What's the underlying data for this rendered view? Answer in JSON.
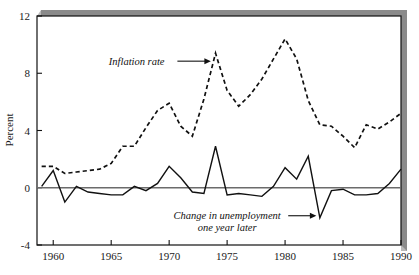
{
  "chart_data": {
    "type": "line",
    "title": "",
    "subtitle": "",
    "xlabel": "",
    "ylabel": "Percent",
    "xlim": [
      1958.6,
      1990
    ],
    "ylim": [
      -4,
      12
    ],
    "xticks": [
      1960,
      1965,
      1970,
      1975,
      1980,
      1985,
      1990
    ],
    "yticks": [
      -4,
      0,
      4,
      8,
      12
    ],
    "xtick_labels": [
      "1960",
      "1965",
      "1970",
      "1975",
      "1980",
      "1985",
      "1990"
    ],
    "ytick_labels": [
      "-4",
      "0",
      "4",
      "8",
      "12"
    ],
    "grid": false,
    "legend": "none",
    "zero_line": 0,
    "x": [
      1959,
      1960,
      1961,
      1962,
      1963,
      1964,
      1965,
      1966,
      1967,
      1968,
      1969,
      1970,
      1971,
      1972,
      1973,
      1974,
      1975,
      1976,
      1977,
      1978,
      1979,
      1980,
      1981,
      1982,
      1983,
      1984,
      1985,
      1986,
      1987,
      1988,
      1989,
      1990
    ],
    "series": [
      {
        "name": "Inflation rate",
        "style": "dashed",
        "color": "#111111",
        "values": [
          1.5,
          1.5,
          1.0,
          1.1,
          1.2,
          1.3,
          1.7,
          2.9,
          2.9,
          4.2,
          5.4,
          5.9,
          4.3,
          3.6,
          6.2,
          9.4,
          6.8,
          5.7,
          6.5,
          7.6,
          9.0,
          10.4,
          9.0,
          6.1,
          4.4,
          4.3,
          3.6,
          2.8,
          4.4,
          4.1,
          4.6,
          5.2
        ]
      },
      {
        "name": "Change in unemployment one year later",
        "style": "solid",
        "color": "#111111",
        "values": [
          0.1,
          1.2,
          -1.0,
          0.1,
          -0.3,
          -0.4,
          -0.5,
          -0.5,
          0.1,
          -0.2,
          0.3,
          1.5,
          0.7,
          -0.3,
          -0.4,
          2.9,
          -0.5,
          -0.4,
          -0.5,
          -0.6,
          0.1,
          1.4,
          0.6,
          2.2,
          -2.1,
          -0.2,
          -0.1,
          -0.5,
          -0.5,
          -0.4,
          0.3,
          1.3
        ]
      }
    ],
    "annotations": [
      {
        "text": "Inflation rate",
        "lines": [
          "Inflation rate"
        ],
        "x": 1967.2,
        "y": 8.6,
        "arrow_to_x": 1973.6,
        "arrow_to_y": 8.6
      },
      {
        "text": "Change in unemployment one year later",
        "lines": [
          "Change in unemployment",
          "one year later"
        ],
        "x": 1975.0,
        "y": -2.2,
        "arrow_to_x": 1982.7,
        "arrow_to_y": -2.0
      }
    ]
  },
  "colors": {
    "frame": "#111111",
    "zero_line": "#6b6b6b",
    "shadow": "#8a8a8a",
    "background": "#ffffff",
    "ink": "#1a1a1a"
  }
}
